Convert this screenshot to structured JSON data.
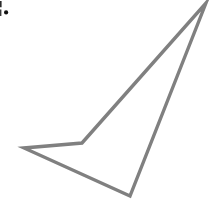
{
  "canvas": {
    "width": 222,
    "height": 202,
    "background_color": "#ffffff"
  },
  "figure": {
    "name": "quadrilateral-outline",
    "stroke_color": "#808080",
    "stroke_width": 3.4,
    "fill": "none",
    "closed": true,
    "vertices": [
      {
        "label": "apex-top-right",
        "x": 206,
        "y": 3
      },
      {
        "label": "bottom",
        "x": 130,
        "y": 196
      },
      {
        "label": "left",
        "x": 24,
        "y": 148
      },
      {
        "label": "concave-middle",
        "x": 82,
        "y": 143
      }
    ],
    "path": "M 206 3 L 130 196 L 24 148 L 82 143 Z"
  },
  "corner_artifact": {
    "name": "clipped-glyph-fragment",
    "description": "Partially cropped dark glyph fragment with a period at the top-left edge",
    "color": "#1a1a1a",
    "x": 0,
    "y": 0,
    "width": 14,
    "height": 20
  }
}
